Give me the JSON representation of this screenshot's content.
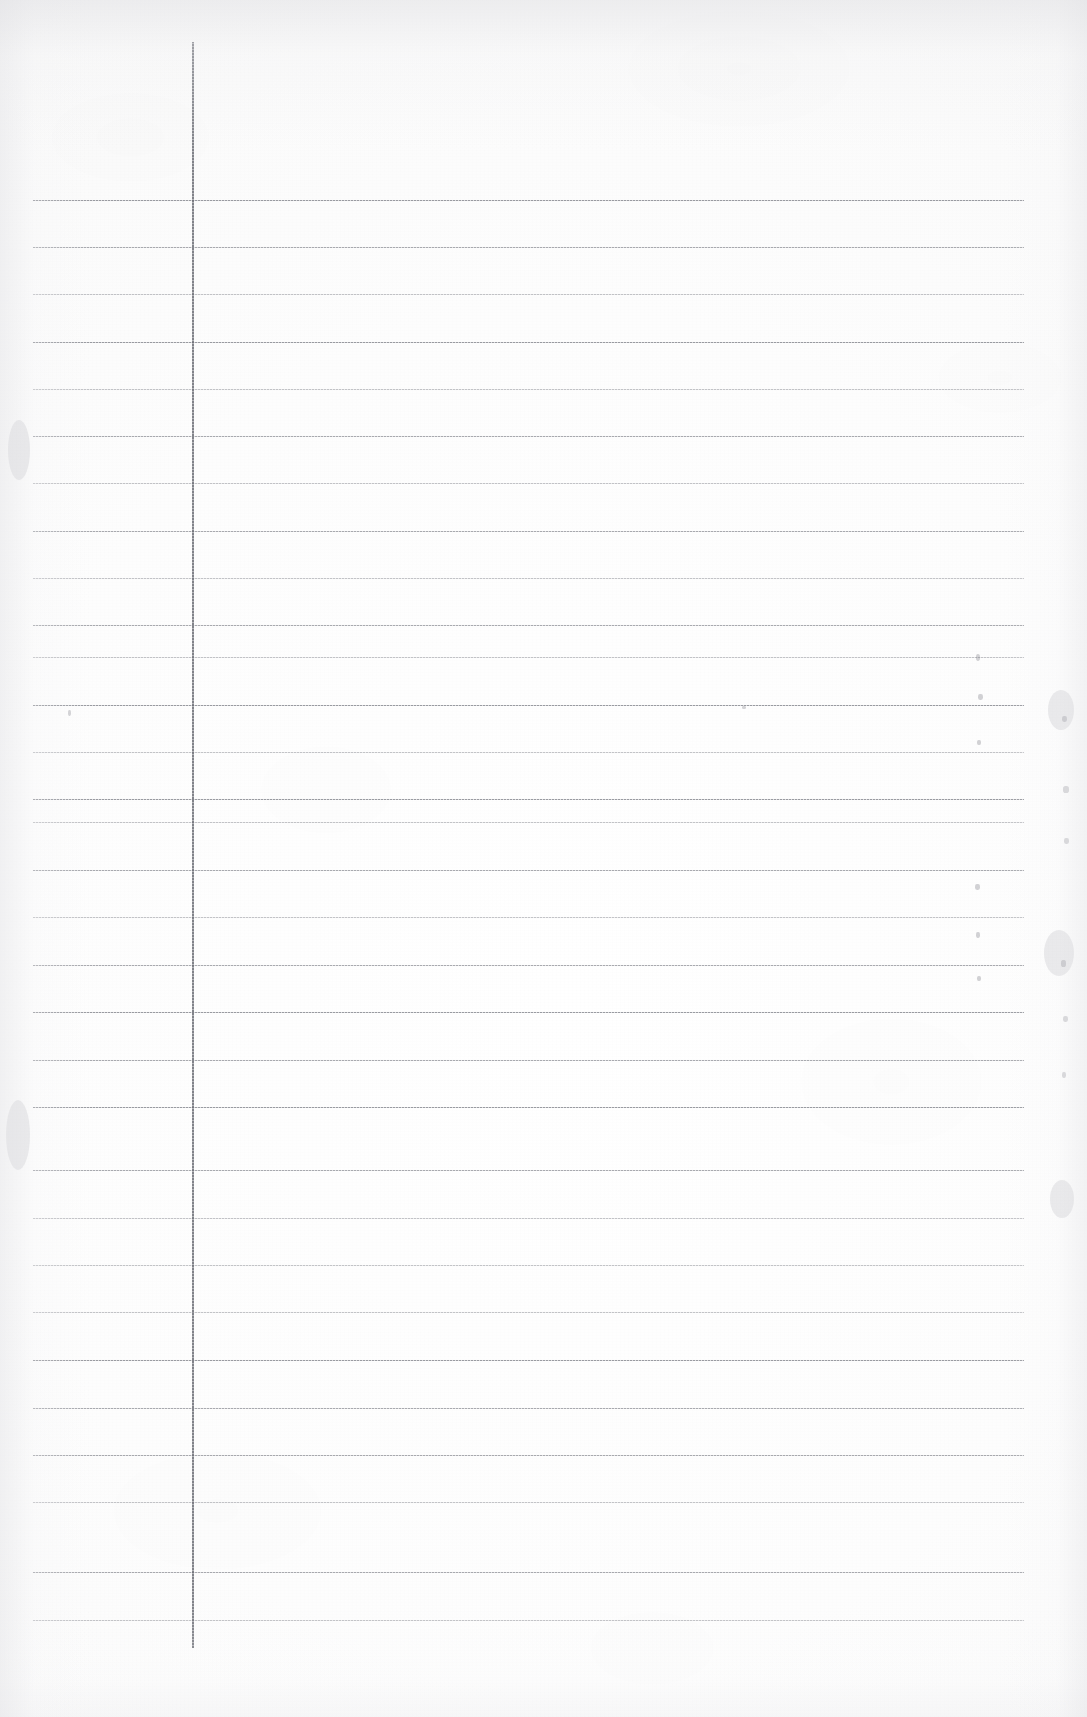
{
  "document": {
    "kind": "scanned-ruled-paper",
    "title": "Blank ruled notebook page (scan)",
    "page_width": 1087,
    "page_height": 1717,
    "has_text": false,
    "text_content": "",
    "colors": {
      "paper": "#fdfdfd",
      "paper_edge": "#f1f1f1",
      "rule_line": "#787a82",
      "margin_line": "#686a72",
      "speck": "#6e6e76"
    }
  },
  "ruling": {
    "orientation": "portrait",
    "style": "horizontal-ruled-with-vertical-margin",
    "line_count": 31,
    "line_spacing_px": 47.5,
    "first_line_y": 200,
    "last_line_y": 1622,
    "line_start_x": 33,
    "line_end_x": 1024,
    "horizontal_lines_y": [
      200,
      247,
      294,
      342,
      389,
      436,
      483,
      531,
      578,
      625,
      657,
      705,
      752,
      799,
      822,
      870,
      917,
      965,
      1012,
      1060,
      1107,
      1170,
      1218,
      1265,
      1312,
      1360,
      1408,
      1455,
      1502,
      1572,
      1620
    ],
    "line_weights": [
      "strong",
      "normal",
      "soft",
      "strong",
      "soft",
      "normal",
      "soft",
      "normal",
      "soft",
      "normal",
      "soft",
      "strong",
      "soft",
      "strong",
      "soft",
      "normal",
      "soft",
      "normal",
      "strong",
      "normal",
      "strong",
      "normal",
      "soft",
      "soft",
      "soft",
      "strong",
      "normal",
      "normal",
      "soft",
      "normal",
      "soft"
    ],
    "margin_line": {
      "x": 192,
      "y_start": 42,
      "y_end": 1648,
      "label": "vertical-margin-rule"
    }
  },
  "artifacts": {
    "description": "faint scanner specks and edge smudges on the paper",
    "specks": [
      {
        "x": 68,
        "y": 710,
        "w": 3,
        "h": 6
      },
      {
        "x": 742,
        "y": 706,
        "w": 4,
        "h": 3
      },
      {
        "x": 976,
        "y": 654,
        "w": 4,
        "h": 7
      },
      {
        "x": 978,
        "y": 694,
        "w": 5,
        "h": 6
      },
      {
        "x": 977,
        "y": 740,
        "w": 4,
        "h": 5
      },
      {
        "x": 975,
        "y": 884,
        "w": 5,
        "h": 6
      },
      {
        "x": 976,
        "y": 932,
        "w": 4,
        "h": 6
      },
      {
        "x": 977,
        "y": 976,
        "w": 4,
        "h": 5
      },
      {
        "x": 1062,
        "y": 716,
        "w": 5,
        "h": 6
      },
      {
        "x": 1063,
        "y": 786,
        "w": 6,
        "h": 7
      },
      {
        "x": 1064,
        "y": 838,
        "w": 5,
        "h": 6
      },
      {
        "x": 1061,
        "y": 960,
        "w": 5,
        "h": 7
      },
      {
        "x": 1063,
        "y": 1016,
        "w": 5,
        "h": 6
      },
      {
        "x": 1062,
        "y": 1072,
        "w": 4,
        "h": 6
      }
    ],
    "edge_smudges": [
      {
        "x": 1048,
        "y": 690,
        "w": 26,
        "h": 40
      },
      {
        "x": 1044,
        "y": 930,
        "w": 30,
        "h": 46
      },
      {
        "x": 1050,
        "y": 1180,
        "w": 24,
        "h": 38
      },
      {
        "x": 8,
        "y": 420,
        "w": 22,
        "h": 60
      },
      {
        "x": 6,
        "y": 1100,
        "w": 24,
        "h": 70
      }
    ]
  }
}
